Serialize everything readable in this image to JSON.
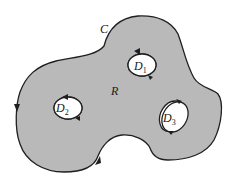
{
  "diagram": {
    "colors": {
      "region_fill": "#b9b9b9",
      "boundary_stroke": "#1f1f1f",
      "hole_fill": "#ffffff",
      "background": "#ffffff"
    },
    "labels": {
      "outer_curve": "C",
      "region": "R",
      "holes": [
        {
          "letter": "D",
          "sub": "1"
        },
        {
          "letter": "D",
          "sub": "2"
        },
        {
          "letter": "D",
          "sub": "3"
        }
      ]
    },
    "orientation": {
      "outer_curve": "counterclockwise",
      "holes": "clockwise"
    }
  }
}
